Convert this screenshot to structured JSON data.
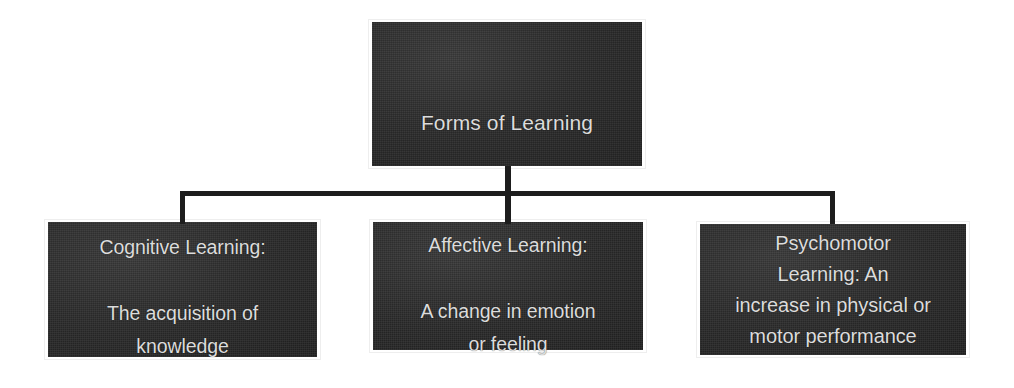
{
  "diagram": {
    "type": "hierarchy-tree",
    "title": "Forms of Learning",
    "background_color": "#ffffff",
    "node_fill_color": "#2b2b2b",
    "node_text_color": "#dcdcdc",
    "connector_color": "#1d1d1d"
  },
  "root": {
    "label": "Forms of Learning"
  },
  "children": [
    {
      "id": "cognitive",
      "heading": "Cognitive Learning:",
      "lines": [
        "Cognitive Learning:",
        "",
        "The acquisition of",
        "knowledge"
      ],
      "description": "The acquisition of knowledge"
    },
    {
      "id": "affective",
      "heading": "Affective Learning:",
      "lines": [
        "Affective Learning:",
        "",
        "A change in emotion",
        "or feeling"
      ],
      "description": "A change in emotion or feeling"
    },
    {
      "id": "psychomotor",
      "heading": "Psychomotor Learning:",
      "lines": [
        "Psychomotor",
        "Learning:  An",
        "increase in physical or",
        "motor performance"
      ],
      "description": "An increase in physical or motor performance"
    }
  ]
}
